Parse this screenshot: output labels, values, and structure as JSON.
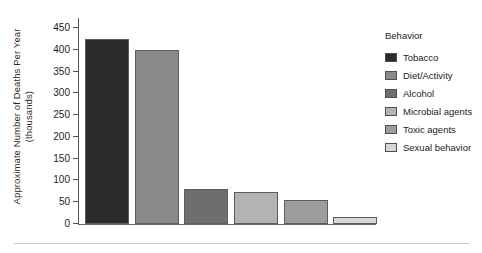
{
  "chart_data": {
    "type": "bar",
    "title": "",
    "xlabel": "",
    "ylabel": "Approximate Number of Deaths Per Year (thousands)",
    "ylabel_line1": "Approximate Number of Deaths Per Year",
    "ylabel_line2": "(thousands)",
    "ylim": [
      0,
      450
    ],
    "yticks": [
      450,
      400,
      350,
      300,
      250,
      200,
      150,
      100,
      50,
      0
    ],
    "ytick_labels": [
      "450",
      "400",
      "350",
      "300",
      "250",
      "200",
      "150",
      "100",
      "50",
      "0"
    ],
    "grid": false,
    "legend_position": "right",
    "legend_title": "Behavior",
    "categories": [
      "Tobacco",
      "Diet/Activity",
      "Alcohol",
      "Microbial agents",
      "Toxic agents",
      "Sexual behavior"
    ],
    "values": [
      425,
      400,
      81,
      73,
      54,
      17
    ],
    "colors": [
      "#2b2b2b",
      "#8a8a8a",
      "#6e6e6e",
      "#b4b4b4",
      "#9d9d9d",
      "#d6d6d6"
    ],
    "bars": [
      {
        "label": "Tobacco",
        "value": 425,
        "color": "#2b2b2b"
      },
      {
        "label": "Diet/Activity",
        "value": 400,
        "color": "#8a8a8a"
      },
      {
        "label": "Alcohol",
        "value": 81,
        "color": "#6e6e6e"
      },
      {
        "label": "Microbial agents",
        "value": 73,
        "color": "#b4b4b4"
      },
      {
        "label": "Toxic agents",
        "value": 54,
        "color": "#9d9d9d"
      },
      {
        "label": "Sexual behavior",
        "value": 17,
        "color": "#d6d6d6"
      }
    ]
  }
}
